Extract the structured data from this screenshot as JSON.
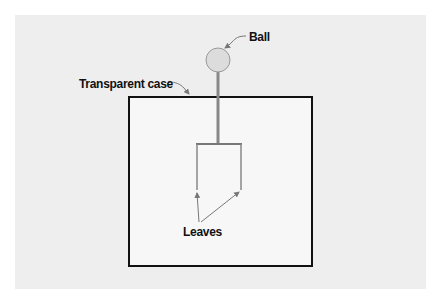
{
  "diagram": {
    "labels": {
      "ball": "Ball",
      "case": "Transparent case",
      "leaves": "Leaves"
    },
    "colors": {
      "background_panel": "#eeeeee",
      "case_fill": "#f7f7f7",
      "case_stroke": "#111111",
      "rod": "#888888",
      "ball_fill": "#dddddd",
      "arrow": "#777777"
    }
  }
}
